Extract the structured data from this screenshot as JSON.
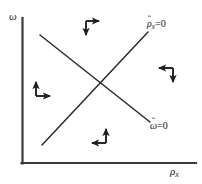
{
  "figure": {
    "type": "phase-plane-diagram",
    "background_color": "#ffffff",
    "line_color": "#262626",
    "text_color": "#1a1a1a",
    "width": 202,
    "height": 184
  },
  "axes": {
    "y_label_symbol": "ω",
    "x_label_symbol": "ρ",
    "x_label_subscript": "x",
    "origin": {
      "x": 22,
      "y": 163
    },
    "y_axis_top": {
      "x": 22,
      "y": 18
    },
    "x_axis_right": {
      "x": 196,
      "y": 163
    }
  },
  "nullclines": [
    {
      "name": "rho-x-nullcline",
      "label_base": "ρ",
      "label_hat": "ˆ",
      "label_subscript": "x",
      "label_equals": "=0",
      "slope_direction": "upward",
      "start": {
        "x": 42,
        "y": 145
      },
      "end": {
        "x": 148,
        "y": 32
      }
    },
    {
      "name": "omega-nullcline",
      "label_base": "ω",
      "label_hat": "ˆ",
      "label_subscript": "",
      "label_equals": "=0",
      "slope_direction": "downward",
      "start": {
        "x": 40,
        "y": 35
      },
      "end": {
        "x": 150,
        "y": 122
      }
    }
  ],
  "intersection": {
    "x": 97,
    "y": 82
  },
  "arrow_pairs": [
    {
      "name": "arrow-pair-top",
      "sector": "top",
      "corner": {
        "x": 86,
        "y": 21
      },
      "directions": [
        "right",
        "down"
      ]
    },
    {
      "name": "arrow-pair-right",
      "sector": "right",
      "corner": {
        "x": 173,
        "y": 68
      },
      "directions": [
        "left",
        "down"
      ]
    },
    {
      "name": "arrow-pair-left",
      "sector": "left",
      "corner": {
        "x": 36,
        "y": 96
      },
      "directions": [
        "up",
        "right"
      ]
    },
    {
      "name": "arrow-pair-bottom",
      "sector": "bottom",
      "corner": {
        "x": 106,
        "y": 143
      },
      "directions": [
        "up",
        "left"
      ]
    }
  ]
}
